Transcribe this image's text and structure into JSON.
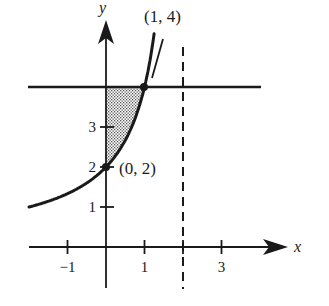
{
  "figure": {
    "axes": {
      "x_label": "x",
      "y_label": "y",
      "x_ticks": [
        {
          "value": -1,
          "label": "−1"
        },
        {
          "value": 1,
          "label": "1"
        },
        {
          "value": 2,
          "label": ""
        },
        {
          "value": 3,
          "label": "3"
        }
      ],
      "y_ticks": [
        {
          "value": 1,
          "label": "1"
        },
        {
          "value": 2,
          "label": "2"
        },
        {
          "value": 3,
          "label": "3"
        }
      ]
    },
    "curve": {
      "function": "y = 4/(2 - x)",
      "x_range": [
        -2,
        1.25
      ]
    },
    "horizontal_line": {
      "y": 4
    },
    "asymptote": {
      "x": 2,
      "style": "dashed"
    },
    "shaded_region": {
      "description": "between y-axis, curve and line y=4 for 0 <= x <= 1",
      "pattern": "stipple"
    },
    "points": [
      {
        "x": 0,
        "y": 2,
        "label": "(0, 2)"
      },
      {
        "x": 1,
        "y": 4,
        "label": "(1, 4)"
      }
    ],
    "colors": {
      "ink": "#1a1a1a",
      "background": "#ffffff",
      "shade": "#9a9a9a"
    }
  }
}
